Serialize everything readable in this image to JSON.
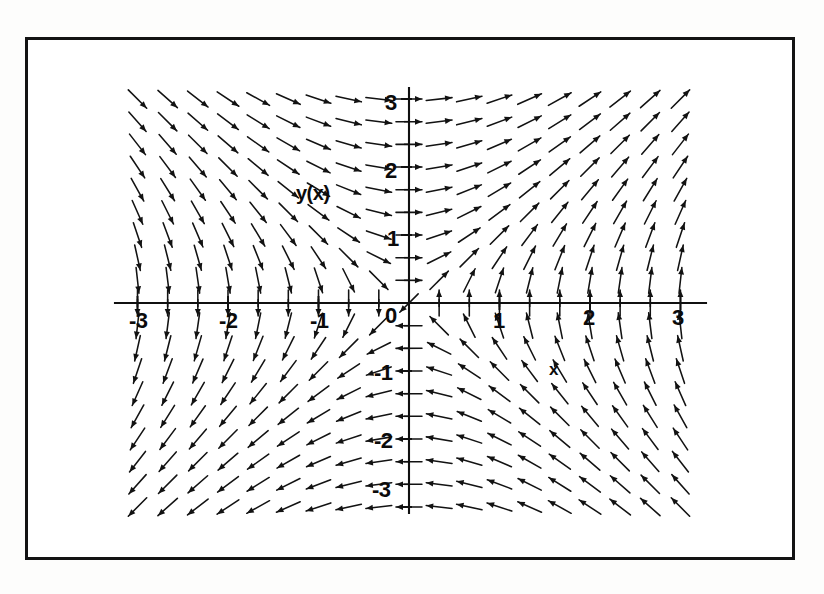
{
  "figure": {
    "kind": "direction-field",
    "axis_name_y": "y(x)",
    "axis_name_x": "x",
    "background": "#ffffff",
    "ink": "#101010",
    "frame_color": "#131313"
  },
  "chart_data": {
    "type": "scatter",
    "title": "",
    "subtitle": "",
    "xlabel": "x",
    "ylabel": "y(x)",
    "xlim": [
      -3.35,
      3.35
    ],
    "ylim": [
      -3.35,
      3.35
    ],
    "grid": false,
    "legend": null,
    "field_model": "slope-field of saddle flow: dx = y, dy = x (unit-normalized arrows)",
    "arrow_grid": {
      "x_start": -3.0,
      "x_end": 3.0,
      "x_step": 0.3333,
      "y_start": -3.0,
      "y_end": 3.0,
      "y_step": 0.3333,
      "arrow_length_px": 26,
      "head_length_px": 7
    },
    "xticks_major": [
      -3,
      -2,
      -1,
      0,
      1,
      2,
      3
    ],
    "xticklabels": [
      "-3",
      "-2",
      "-1",
      "0",
      "1",
      "2",
      "3"
    ],
    "yticks_major": [
      -3,
      -2,
      -1,
      0,
      1,
      2,
      3
    ],
    "yticklabels": [
      "-3",
      "-2",
      "-1",
      "0",
      "1",
      "2",
      "3"
    ],
    "minor_ticks_per_major": 3,
    "axis_x_range_px": [
      115,
      706
    ],
    "axis_y_range_px": [
      88,
      513
    ],
    "origin_px": [
      409,
      303
    ],
    "px_per_unit_x": 90.5,
    "px_per_unit_y": 68.0,
    "annotations": [
      {
        "text": "y(x)",
        "x": -1.25,
        "y": 1.6
      },
      {
        "text": "x",
        "x": 1.55,
        "y": -0.55
      }
    ]
  },
  "labels": {
    "x_neg3": "-3",
    "x_neg2": "-2",
    "x_neg1": "-1",
    "x_zero": "0",
    "x_pos1": "1",
    "x_pos2": "2",
    "x_pos3": "3",
    "y_pos3": "3",
    "y_pos2": "2",
    "y_pos1": "1",
    "y_neg1": "-1",
    "y_neg2": "-2",
    "y_neg3": "-3",
    "y_axis_name": "y(x)",
    "x_axis_name": "x"
  }
}
